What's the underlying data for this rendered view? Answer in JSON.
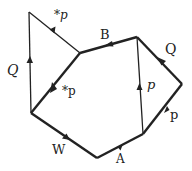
{
  "diagram": {
    "vertices": {
      "v_topleft": [
        29,
        12
      ],
      "v_junction": [
        80,
        53
      ],
      "v_topright": [
        137,
        37
      ],
      "v_right": [
        182,
        84
      ],
      "v_bottomright": [
        143,
        134
      ],
      "v_bottom": [
        97,
        158
      ],
      "v_left": [
        31,
        113
      ]
    },
    "edges": [
      {
        "id": "e_Q_left",
        "from": "v_left",
        "to": "v_topleft",
        "label": "Q",
        "style": "italic",
        "weight": "thin"
      },
      {
        "id": "e_starp_top",
        "from": "v_junction",
        "to": "v_topleft",
        "label": "*p",
        "style": "italic",
        "weight": "thin"
      },
      {
        "id": "e_starp_mid",
        "from": "v_junction",
        "to": "v_left",
        "label": "*p",
        "style": "normal",
        "weight": "thick"
      },
      {
        "id": "e_B",
        "from": "v_topright",
        "to": "v_junction",
        "label": "B",
        "style": "normal",
        "weight": "thick"
      },
      {
        "id": "e_Q_right",
        "from": "v_right",
        "to": "v_topright",
        "label": "Q",
        "style": "normal",
        "weight": "thick"
      },
      {
        "id": "e_p_inner",
        "from": "v_bottomright",
        "to": "v_topright",
        "label": "p",
        "style": "italic",
        "weight": "thin"
      },
      {
        "id": "e_p_right",
        "from": "v_bottomright",
        "to": "v_right",
        "label": "p",
        "style": "normal",
        "weight": "thick"
      },
      {
        "id": "e_W",
        "from": "v_left",
        "to": "v_bottom",
        "label": "W",
        "style": "normal",
        "weight": "thick"
      },
      {
        "id": "e_A",
        "from": "v_bottom",
        "to": "v_bottomright",
        "label": "A",
        "style": "normal",
        "weight": "thick"
      }
    ],
    "labels": {
      "Q_left": "Q",
      "starp_top": "*p",
      "starp_mid": "*p",
      "B": "B",
      "Q_right": "Q",
      "p_inner": "p",
      "p_right": "p",
      "W": "W",
      "A": "A"
    },
    "colors": {
      "line": "#222222",
      "background": "#ffffff"
    }
  }
}
